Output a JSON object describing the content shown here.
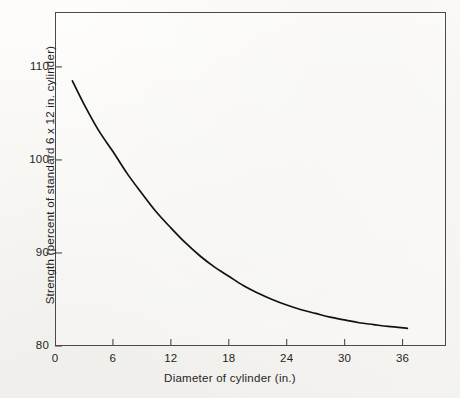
{
  "figure": {
    "background_color": "#fbfaf8",
    "frame_color": "#4a4a4a",
    "curve_color": "#111111"
  },
  "chart_data": {
    "type": "line",
    "title": "",
    "subtitle": "",
    "xlabel": "Diameter of cylinder (in.)",
    "ylabel": "Strength (percent of standard 6 x 12 in. cylinder)",
    "xlim": [
      0,
      40.5
    ],
    "ylim": [
      80,
      115.9
    ],
    "xticks": [
      0,
      6,
      12,
      18,
      24,
      30,
      36
    ],
    "xtick_labels": [
      "0",
      "6",
      "12",
      "18",
      "24",
      "30",
      "36"
    ],
    "yticks": [
      80,
      90,
      100,
      110
    ],
    "ytick_labels": [
      "80",
      "90",
      "100",
      "110"
    ],
    "grid": false,
    "legend": null,
    "annotations": [],
    "series": [
      {
        "name": "Strength vs diameter",
        "color": "#111111",
        "x": [
          1.8,
          3,
          4.5,
          6,
          7.5,
          9,
          10.5,
          12,
          13.5,
          15,
          16.5,
          18,
          19.5,
          21,
          22.5,
          24,
          25.5,
          27,
          28.5,
          30,
          31.5,
          33,
          34.5,
          36.5
        ],
        "y": [
          108.5,
          106.0,
          103.2,
          100.9,
          98.5,
          96.4,
          94.4,
          92.7,
          91.1,
          89.7,
          88.5,
          87.5,
          86.5,
          85.7,
          85.0,
          84.4,
          83.9,
          83.5,
          83.1,
          82.8,
          82.5,
          82.3,
          82.1,
          81.9
        ]
      }
    ]
  }
}
